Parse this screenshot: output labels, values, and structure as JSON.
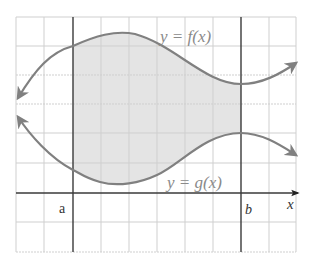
{
  "figure": {
    "curve_f_label": "y = f(x)",
    "curve_g_label": "y = g(x)",
    "x_axis_label": "x",
    "bound_a_label": "a",
    "bound_b_label": "b"
  },
  "colors": {
    "grid_light": "#cfcfcf",
    "grid_dark": "#3a3a3a",
    "curve": "#808080",
    "shade": "#e2e2e2",
    "label": "#8a8a8a",
    "axis_label": "#333333"
  }
}
